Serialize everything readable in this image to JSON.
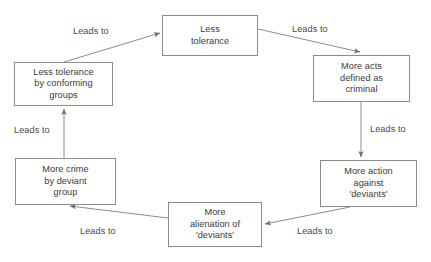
{
  "diagram": {
    "type": "cycle-flowchart",
    "direction": "clockwise",
    "stroke_color": "#8c8c8c",
    "text_color": "#3a3a3a",
    "background_color": "#ffffff",
    "nodes": [
      {
        "id": "less-tolerance",
        "label": "Less\ntolerance"
      },
      {
        "id": "more-acts",
        "label": "More acts\ndefined as\ncriminal"
      },
      {
        "id": "more-action",
        "label": "More action\nagainst\n'deviants'"
      },
      {
        "id": "more-alienation",
        "label": "More\nalienation of\n'deviants'"
      },
      {
        "id": "more-crime",
        "label": "More crime\nby deviant\ngroup"
      },
      {
        "id": "less-tolerance-conf",
        "label": "Less tolerance\nby conforming\ngroups"
      }
    ],
    "edges": [
      {
        "id": "less-to-acts",
        "from": "less-tolerance",
        "to": "more-acts",
        "label": "Leads to"
      },
      {
        "id": "acts-to-action",
        "from": "more-acts",
        "to": "more-action",
        "label": "Leads to"
      },
      {
        "id": "action-to-alien",
        "from": "more-action",
        "to": "more-alienation",
        "label": "Leads to"
      },
      {
        "id": "alien-to-crime",
        "from": "more-alienation",
        "to": "more-crime",
        "label": "Leads to"
      },
      {
        "id": "crime-to-conf",
        "from": "more-crime",
        "to": "less-tolerance-conf",
        "label": "Leads to"
      },
      {
        "id": "conf-to-less",
        "from": "less-tolerance-conf",
        "to": "less-tolerance",
        "label": "Leads to"
      }
    ]
  }
}
